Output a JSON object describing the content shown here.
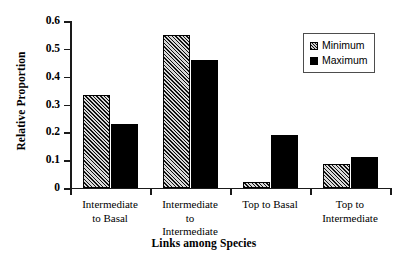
{
  "chart_data": {
    "type": "bar",
    "title": "",
    "xlabel": "Links among Species",
    "ylabel": "Relative Proportion",
    "ylim": [
      0,
      0.6
    ],
    "yticks": [
      "0",
      "0.1",
      "0.2",
      "0.3",
      "0.4",
      "0.5",
      "0.6"
    ],
    "ytick_values": [
      0,
      0.1,
      0.2,
      0.3,
      0.4,
      0.5,
      0.6
    ],
    "grid": false,
    "legend_position": "top-right",
    "categories": [
      "Intermediate\nto Basal",
      "Intermediate\nto\nIntermediate",
      "Top to Basal",
      "Top to\nIntermediate"
    ],
    "category_lines": [
      [
        "Intermediate",
        "to Basal"
      ],
      [
        "Intermediate",
        "to",
        "Intermediate"
      ],
      [
        "Top to Basal"
      ],
      [
        "Top to",
        "Intermediate"
      ]
    ],
    "series": [
      {
        "name": "Minimum",
        "fill": "hatched",
        "color": "#1a1a1a",
        "values": [
          0.335,
          0.55,
          0.02,
          0.085
        ]
      },
      {
        "name": "Maximum",
        "fill": "solid",
        "color": "#000000",
        "values": [
          0.23,
          0.46,
          0.19,
          0.11
        ]
      }
    ]
  },
  "legend": {
    "items": [
      {
        "label": "Minimum"
      },
      {
        "label": "Maximum"
      }
    ]
  }
}
